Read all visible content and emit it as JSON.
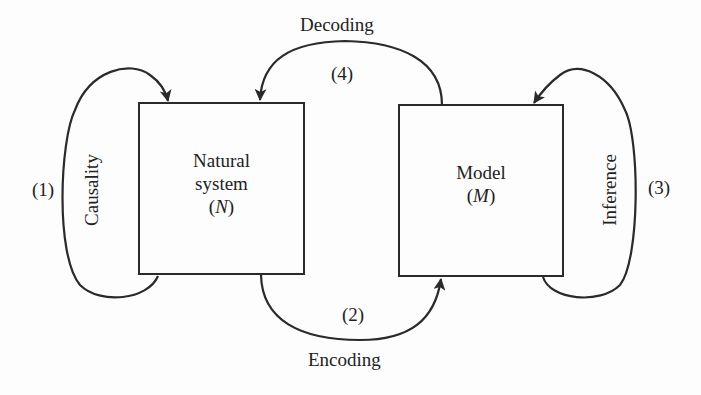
{
  "diagram": {
    "nodes": {
      "natural_system": {
        "line1": "Natural",
        "line2": "system",
        "symbol_open": "(",
        "symbol": "N",
        "symbol_close": ")"
      },
      "model": {
        "line1": "Model",
        "symbol_open": "(",
        "symbol": "M",
        "symbol_close": ")"
      }
    },
    "edges": {
      "causality": {
        "number": "(1)",
        "label": "Causality",
        "from": "Natural system",
        "to": "Natural system"
      },
      "encoding": {
        "number": "(2)",
        "label": "Encoding",
        "from": "Natural system",
        "to": "Model"
      },
      "inference": {
        "number": "(3)",
        "label": "Inference",
        "from": "Model",
        "to": "Model"
      },
      "decoding": {
        "number": "(4)",
        "label": "Decoding",
        "from": "Model",
        "to": "Natural system"
      }
    },
    "colors": {
      "stroke": "#2a2a2a",
      "background": "#fdfdfd"
    }
  }
}
